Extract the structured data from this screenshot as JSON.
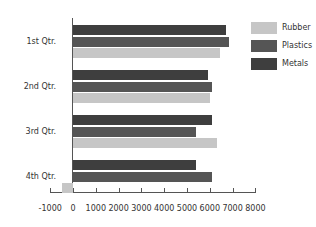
{
  "chart_data": {
    "type": "bar",
    "orientation": "horizontal",
    "title": "",
    "xlabel": "",
    "ylabel": "",
    "categories": [
      "1st Qtr.",
      "2nd Qtr.",
      "3rd Qtr.",
      "4th Qtr."
    ],
    "series": [
      {
        "name": "Metals",
        "color": "#3e3e3e",
        "values": [
          6700,
          5900,
          6100,
          5400
        ]
      },
      {
        "name": "Plastics",
        "color": "#555555",
        "values": [
          6850,
          6100,
          5400,
          6100
        ]
      },
      {
        "name": "Rubber",
        "color": "#c6c6c6",
        "values": [
          6450,
          6000,
          6300,
          -500
        ]
      }
    ],
    "xlim": [
      -1000,
      8000
    ],
    "x_ticks": [
      "-1000",
      "0",
      "1000",
      "2000",
      "3000",
      "4000",
      "5000",
      "6000",
      "7000",
      "8000"
    ],
    "grid": false,
    "legend": {
      "position": "right",
      "entries": [
        {
          "label": "Rubber",
          "color": "#c6c6c6"
        },
        {
          "label": "Plastics",
          "color": "#555555"
        },
        {
          "label": "Metals",
          "color": "#3e3e3e"
        }
      ]
    }
  }
}
